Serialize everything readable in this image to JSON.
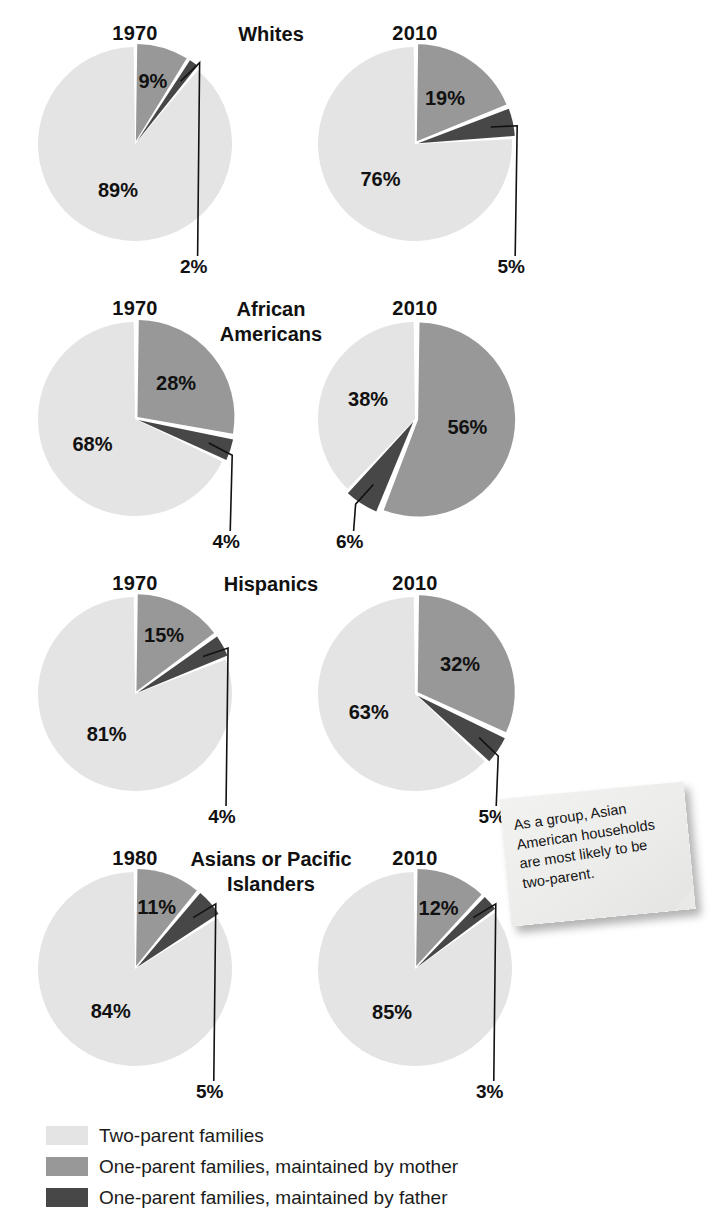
{
  "chart_data": {
    "type": "pie",
    "title": "",
    "legend": {
      "position": "bottom-left",
      "entries": [
        {
          "label": "Two-parent families",
          "color": "#e4e4e4"
        },
        {
          "label": "One-parent families, maintained by mother",
          "color": "#989898"
        },
        {
          "label": "One-parent families, maintained by father",
          "color": "#474747"
        }
      ]
    },
    "series_names": [
      "Two-parent families",
      "One-parent families, maintained by mother",
      "One-parent families, maintained by father"
    ],
    "groups": [
      {
        "name": "Whites",
        "charts": [
          {
            "year": "1970",
            "values": [
              89,
              9,
              2
            ],
            "labels": [
              "89%",
              "9%",
              "2%"
            ]
          },
          {
            "year": "2010",
            "values": [
              76,
              19,
              5
            ],
            "labels": [
              "76%",
              "19%",
              "5%"
            ]
          }
        ]
      },
      {
        "name": "African Americans",
        "charts": [
          {
            "year": "1970",
            "values": [
              68,
              28,
              4
            ],
            "labels": [
              "68%",
              "28%",
              "4%"
            ]
          },
          {
            "year": "2010",
            "values": [
              38,
              56,
              6
            ],
            "labels": [
              "38%",
              "56%",
              "6%"
            ]
          }
        ]
      },
      {
        "name": "Hispanics",
        "charts": [
          {
            "year": "1970",
            "values": [
              81,
              15,
              4
            ],
            "labels": [
              "81%",
              "15%",
              "4%"
            ]
          },
          {
            "year": "2010",
            "values": [
              63,
              32,
              5
            ],
            "labels": [
              "63%",
              "32%",
              "5%"
            ]
          }
        ]
      },
      {
        "name": "Asians or Pacific Islanders",
        "charts": [
          {
            "year": "1980",
            "values": [
              84,
              11,
              5
            ],
            "labels": [
              "84%",
              "11%",
              "5%"
            ]
          },
          {
            "year": "2010",
            "values": [
              85,
              12,
              3
            ],
            "labels": [
              "85%",
              "12%",
              "3%"
            ]
          }
        ]
      }
    ]
  },
  "note": {
    "text": "As a group, Asian American households are most likely to be two-parent."
  },
  "colors": {
    "two_parent": "#e4e4e4",
    "mother": "#989898",
    "father": "#474747",
    "gap": "#ffffff",
    "text": "#111111"
  }
}
